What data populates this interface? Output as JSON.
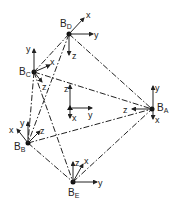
{
  "diagram": {
    "nodes": [
      {
        "id": "A",
        "label": "B",
        "sub": "A",
        "x": 152,
        "y": 109
      },
      {
        "id": "B",
        "label": "B",
        "sub": "B",
        "x": 28,
        "y": 143
      },
      {
        "id": "C",
        "label": "B",
        "sub": "C",
        "x": 34,
        "y": 72
      },
      {
        "id": "D",
        "label": "B",
        "sub": "D",
        "x": 69,
        "y": 34
      },
      {
        "id": "E",
        "label": "B",
        "sub": "E",
        "x": 73,
        "y": 182
      }
    ],
    "edges": [
      [
        "D",
        "A"
      ],
      [
        "D",
        "C"
      ],
      [
        "D",
        "B"
      ],
      [
        "C",
        "A"
      ],
      [
        "C",
        "B"
      ],
      [
        "C",
        "E"
      ],
      [
        "B",
        "A"
      ],
      [
        "B",
        "E"
      ],
      [
        "E",
        "A"
      ]
    ],
    "axis_labels": {
      "x": "x",
      "y": "y",
      "z": "z"
    },
    "center_frame": {
      "x": 70,
      "y": 108
    }
  }
}
